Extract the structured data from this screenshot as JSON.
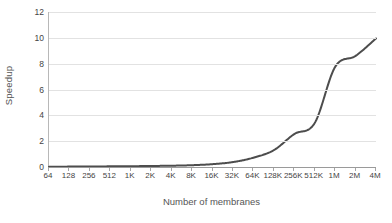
{
  "chart_data": {
    "type": "line",
    "title": "",
    "subtitle": "",
    "xlabel": "Number of membranes",
    "ylabel": "Speedup",
    "categories": [
      "64",
      "128",
      "256",
      "512",
      "1K",
      "2K",
      "4K",
      "8K",
      "16K",
      "32K",
      "64K",
      "128K",
      "256K",
      "512K",
      "1M",
      "2M",
      "4M"
    ],
    "values": [
      0.02,
      0.03,
      0.04,
      0.05,
      0.06,
      0.08,
      0.1,
      0.14,
      0.22,
      0.38,
      0.72,
      1.3,
      2.55,
      3.4,
      7.75,
      8.6,
      9.95
    ],
    "series": [
      {
        "name": "Speedup",
        "color": "#4d4d4d",
        "values": [
          0.02,
          0.03,
          0.04,
          0.05,
          0.06,
          0.08,
          0.1,
          0.14,
          0.22,
          0.38,
          0.72,
          1.3,
          2.55,
          3.4,
          7.75,
          8.6,
          9.95
        ]
      }
    ],
    "ylim": [
      0,
      12
    ],
    "yticks": [
      0,
      2,
      4,
      6,
      8,
      10,
      12
    ],
    "ytick_labels": [
      "0",
      "2",
      "4",
      "6",
      "8",
      "10",
      "12"
    ],
    "xtick_labels": [
      "64",
      "128",
      "256",
      "512",
      "1K",
      "2K",
      "4K",
      "8K",
      "16K",
      "32K",
      "64K",
      "128K",
      "256K",
      "512K",
      "1M",
      "2M",
      "4M"
    ],
    "grid": true,
    "grid_axis": "y",
    "grid_color": "#e2e2e2",
    "legend": false,
    "legend_position": "none",
    "axis_color": "#9a9a9a",
    "line_color": "#4d4d4d",
    "line_width": 2,
    "background": "#ffffff",
    "annotations": []
  }
}
